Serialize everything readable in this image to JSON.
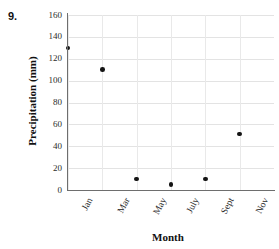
{
  "problem": {
    "number": "9."
  },
  "chart_data": {
    "type": "scatter",
    "title": "",
    "xlabel": "Month",
    "ylabel": "Precipitation (mm)",
    "categories": [
      "Jan",
      "Mar",
      "May",
      "July",
      "Sept",
      "Nov"
    ],
    "values": [
      130,
      110,
      10,
      5,
      10,
      51
    ],
    "series": [
      {
        "name": "Precipitation",
        "values": [
          130,
          110,
          10,
          5,
          10,
          51
        ]
      }
    ],
    "points": [
      {
        "x": "Jan",
        "y": 130
      },
      {
        "x": "Mar",
        "y": 110
      },
      {
        "x": "May",
        "y": 10
      },
      {
        "x": "July",
        "y": 5
      },
      {
        "x": "Sept",
        "y": 10
      },
      {
        "x": "Nov",
        "y": 51
      }
    ],
    "ylim": [
      0,
      160
    ],
    "yticks": [
      0,
      20,
      40,
      60,
      80,
      100,
      120,
      140,
      160
    ],
    "ytick_labels": [
      "0",
      "20",
      "40",
      "60",
      "80",
      "100",
      "120",
      "140",
      "160"
    ],
    "xtick_labels": [
      "Jan",
      "Mar",
      "May",
      "July",
      "Sept",
      "Nov"
    ],
    "grid": true,
    "legend": false,
    "marker": "filled-circle",
    "marker_color": "#141414",
    "gridline_color": "#e3e3e3",
    "axis_color": "#6e6e6e"
  }
}
